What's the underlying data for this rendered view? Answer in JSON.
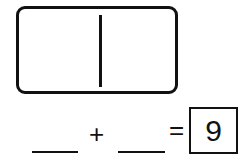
{
  "domino": {
    "left_dots": 0,
    "right_dots": 0
  },
  "equation": {
    "addend1": "",
    "plus": "+",
    "addend2": "",
    "equals": "=",
    "sum": "9"
  }
}
